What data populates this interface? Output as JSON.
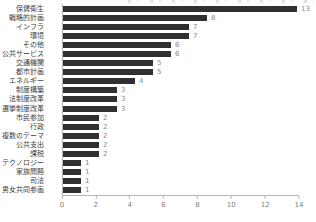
{
  "chart_data": {
    "type": "bar",
    "orientation": "horizontal",
    "title": "",
    "xlabel": "",
    "ylabel": "",
    "categories": [
      "保健衛生",
      "戦略的計画",
      "インフラ",
      "環境",
      "その他",
      "公共サービス",
      "交通機関",
      "都市計画",
      "エネルギー",
      "制度構築",
      "法制度改革",
      "選挙制度改革",
      "市民参加",
      "行政",
      "複数のテーマ",
      "公共支出",
      "課税",
      "テクノロジー",
      "家族問題",
      "司法",
      "男女共同参画"
    ],
    "values": [
      13,
      8,
      7,
      7,
      6,
      6,
      5,
      5,
      4,
      3,
      3,
      3,
      2,
      2,
      2,
      2,
      2,
      1,
      1,
      1,
      1
    ],
    "value_labels": [
      "13",
      "8",
      "7",
      "7",
      "6",
      "6",
      "5",
      "5",
      "4",
      "3",
      "3",
      "3",
      "2",
      "2",
      "2",
      "2",
      "2",
      "1",
      "1",
      "1",
      "1"
    ],
    "xlim": [
      0,
      14
    ],
    "xticks": [
      "0",
      "2",
      "4",
      "6",
      "8",
      "10",
      "12",
      "14"
    ],
    "xtick_values": [
      0,
      2,
      4,
      6,
      8,
      10,
      12,
      14
    ],
    "grid": false,
    "legend": null,
    "colors": {
      "bar": "#303030",
      "value_label": "#8a8a8a",
      "tick_label": "#7d7d7d",
      "category_label": "#3d3d3d",
      "axis": "#b5b5b5",
      "background": "#ffffff"
    }
  }
}
